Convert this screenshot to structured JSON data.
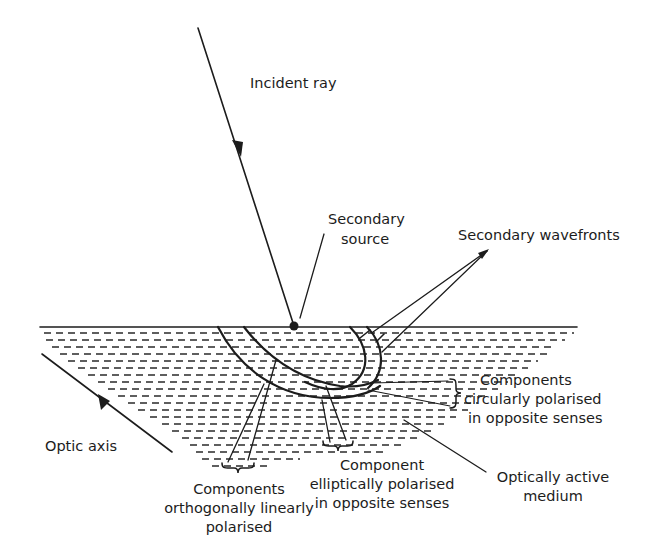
{
  "figure": {
    "background": "#ffffff",
    "ink": "#1c1c1c"
  },
  "labels": {
    "incident_ray": "Incident ray",
    "secondary_source": [
      "Secondary",
      "source"
    ],
    "secondary_wavefronts": "Secondary wavefronts",
    "components_circular": [
      "Components",
      "circularly polarised",
      "in opposite senses"
    ],
    "optic_axis": "Optic axis",
    "components_linear": [
      "Components",
      "orthogonally linearly",
      "polarised"
    ],
    "component_elliptical": [
      "Component",
      "elliptically polarised",
      "in opposite senses"
    ],
    "optically_active_medium": [
      "Optically active",
      "medium"
    ]
  },
  "geometry": {
    "surface_y": 327,
    "surface_x": [
      40,
      577
    ],
    "incident_ray": {
      "from": [
        198,
        28
      ],
      "to": [
        294,
        326
      ],
      "arrow_at": [
        238,
        150
      ]
    },
    "secondary_source_point": [
      294,
      326
    ],
    "optic_axis_line": {
      "from": [
        42,
        354
      ],
      "to": [
        172,
        452
      ],
      "arrow_at": [
        107,
        403
      ]
    }
  }
}
